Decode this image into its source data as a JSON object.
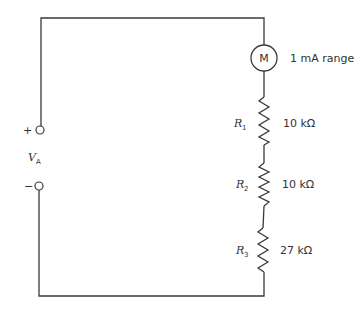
{
  "diagram": {
    "type": "series circuit",
    "source": {
      "symbol": "V",
      "subscript": "A",
      "plus_label": "+",
      "minus_label": "−"
    },
    "meter": {
      "symbol": "M",
      "label": "1 mA range"
    },
    "resistors": [
      {
        "symbol": "R",
        "subscript": "1",
        "value": "10 kΩ"
      },
      {
        "symbol": "R",
        "subscript": "2",
        "value": "10 kΩ"
      },
      {
        "symbol": "R",
        "subscript": "3",
        "value": "27 kΩ"
      }
    ]
  }
}
